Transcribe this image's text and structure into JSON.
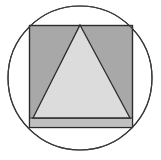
{
  "figure": {
    "title": "Geometric figure: triangle inscribed in square inscribed in circle",
    "canvas": {
      "width": 161,
      "height": 160,
      "background_color": "#ffffff"
    },
    "colors": {
      "background": "#ffffff",
      "circle_fill": "#ffffff",
      "circle_stroke": "#3a3a3a",
      "square_fill": "#a8a8a8",
      "square_stroke": "#2b2b2b",
      "triangle_fill": "#dcdcdc",
      "triangle_stroke": "#2b2b2b",
      "base_band_fill": "#c0c0c0",
      "base_band_stroke": "#2b2b2b"
    },
    "shapes": [
      {
        "name": "circle",
        "type": "circle",
        "cx": 80,
        "cy": 78,
        "r": 72,
        "fill": "#ffffff",
        "stroke": "#3a3a3a",
        "stroke_width": 1.2,
        "label": "Outer circle"
      },
      {
        "name": "square",
        "type": "rect",
        "x": 29,
        "y": 25,
        "width": 104,
        "height": 103,
        "fill": "#a8a8a8",
        "stroke": "#2b2b2b",
        "stroke_width": 1.2,
        "label": "Inscribed square"
      },
      {
        "name": "base-band",
        "type": "rect",
        "x": 29,
        "y": 118,
        "width": 104,
        "height": 10,
        "fill": "#c0c0c0",
        "stroke": "#2b2b2b",
        "stroke_width": 1,
        "label": "Lower band strip"
      },
      {
        "name": "triangle",
        "type": "polygon",
        "points": "80,25 130,118 33,118",
        "apex": [
          80,
          25
        ],
        "base_left": [
          33,
          118
        ],
        "base_right": [
          130,
          118
        ],
        "fill": "#dcdcdc",
        "stroke": "#2b2b2b",
        "stroke_width": 1.3,
        "label": "Inscribed triangle"
      }
    ]
  }
}
